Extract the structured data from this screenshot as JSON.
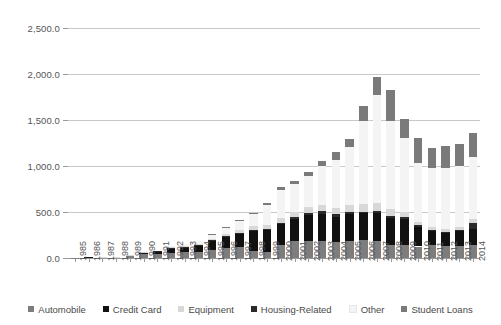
{
  "chart_data": {
    "type": "bar",
    "stacked": true,
    "title": "",
    "subtitle": "",
    "xlabel": "",
    "ylabel": "",
    "ylim": [
      0,
      2500
    ],
    "ytick_values": [
      0,
      500,
      1000,
      1500,
      2000,
      2500
    ],
    "ytick_labels": [
      "0.0",
      "500.0",
      "1,000.0",
      "1,500.0",
      "2,000.0",
      "2,500.0"
    ],
    "grid": true,
    "legend_position": "bottom",
    "categories": [
      "1985",
      "1986",
      "1987",
      "1988",
      "1989",
      "1990",
      "1991",
      "1992",
      "1993",
      "1994",
      "1995",
      "1996",
      "1997",
      "1998",
      "1999",
      "2000",
      "2001",
      "2002",
      "2003",
      "2004",
      "2005",
      "2006",
      "2007",
      "2008",
      "2009",
      "2010",
      "2011",
      "2012",
      "2013",
      "2014"
    ],
    "series": [
      {
        "name": "Automobile",
        "color": "#7d7d7d",
        "values": [
          1,
          6,
          8,
          10,
          22,
          40,
          45,
          55,
          62,
          68,
          90,
          110,
          118,
          75,
          70,
          145,
          185,
          180,
          190,
          170,
          180,
          195,
          190,
          145,
          140,
          125,
          140,
          130,
          130,
          145
        ]
      },
      {
        "name": "Credit Card",
        "color": "#111111",
        "values": [
          0,
          2,
          3,
          5,
          8,
          20,
          28,
          50,
          58,
          62,
          95,
          120,
          145,
          215,
          230,
          220,
          240,
          285,
          290,
          280,
          295,
          290,
          300,
          295,
          285,
          215,
          150,
          140,
          160,
          175
        ]
      },
      {
        "name": "Housing-Related",
        "color": "#2a2a2a",
        "values": [
          0,
          0,
          0,
          0,
          0,
          2,
          3,
          4,
          5,
          6,
          8,
          10,
          12,
          14,
          16,
          20,
          22,
          24,
          26,
          24,
          22,
          20,
          22,
          20,
          16,
          14,
          12,
          10,
          12,
          60
        ]
      },
      {
        "name": "Equipment",
        "color": "#d8d8d8",
        "values": [
          0,
          0,
          1,
          1,
          2,
          4,
          6,
          8,
          10,
          14,
          18,
          24,
          30,
          40,
          45,
          50,
          55,
          60,
          65,
          70,
          75,
          80,
          85,
          75,
          60,
          40,
          35,
          35,
          38,
          40
        ]
      },
      {
        "name": "Other",
        "color": "#f4f4f4",
        "values": [
          0,
          0,
          0,
          0,
          0,
          5,
          10,
          15,
          20,
          30,
          45,
          70,
          95,
          130,
          215,
          305,
          300,
          345,
          425,
          525,
          630,
          905,
          1170,
          955,
          805,
          640,
          640,
          665,
          660,
          680
        ]
      },
      {
        "name": "Student Loans",
        "color": "#7a7a7a",
        "values": [
          0,
          0,
          0,
          0,
          0,
          0,
          0,
          0,
          0,
          0,
          4,
          8,
          12,
          18,
          22,
          28,
          35,
          42,
          55,
          85,
          95,
          160,
          195,
          335,
          205,
          265,
          215,
          235,
          235,
          260
        ]
      }
    ],
    "totals": [
      1,
      8,
      12,
      16,
      32,
      71,
      92,
      132,
      155,
      180,
      260,
      342,
      412,
      492,
      598,
      768,
      837,
      936,
      1051,
      1154,
      1297,
      1650,
      1962,
      1825,
      1711,
      1299,
      1192,
      1215,
      1235,
      1360
    ]
  },
  "legend": {
    "items": [
      {
        "label": "Automobile",
        "color": "#7d7d7d"
      },
      {
        "label": "Credit Card",
        "color": "#111111"
      },
      {
        "label": "Equipment",
        "color": "#d8d8d8"
      },
      {
        "label": "Housing-Related",
        "color": "#2a2a2a"
      },
      {
        "label": "Other",
        "color": "#f4f4f4"
      },
      {
        "label": "Student Loans",
        "color": "#7a7a7a"
      }
    ]
  }
}
